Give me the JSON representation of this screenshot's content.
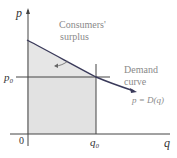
{
  "diagram": {
    "axes": {
      "y_label": "p",
      "x_label": "q",
      "origin_label": "0"
    },
    "ticks": {
      "p0": "p₀",
      "q0": "q₀"
    },
    "annotations": {
      "surplus_line1": "Consumers'",
      "surplus_line2": "surplus",
      "demand_line1": "Demand",
      "demand_line2": "curve",
      "equation": "p = D(q)"
    },
    "colors": {
      "fill": "#e6e6e6",
      "curve": "#3a3a5a",
      "axis": "#333333",
      "label_gray": "#8a8a8a"
    }
  }
}
